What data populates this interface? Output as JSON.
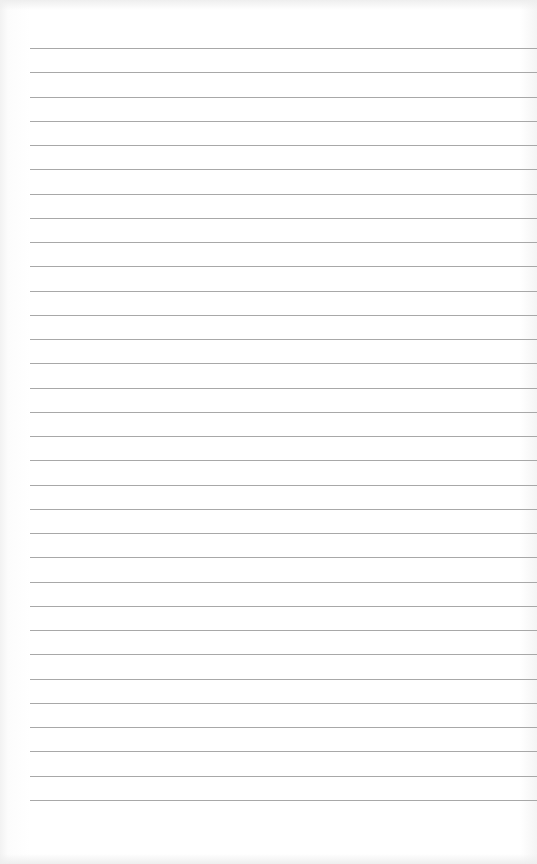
{
  "page": {
    "type": "lined-paper",
    "line_count": 32,
    "first_line_y": 48,
    "line_spacing": 24.25,
    "line_left": 30,
    "line_color": "#a8a8a8",
    "background_color": "#ffffff"
  }
}
